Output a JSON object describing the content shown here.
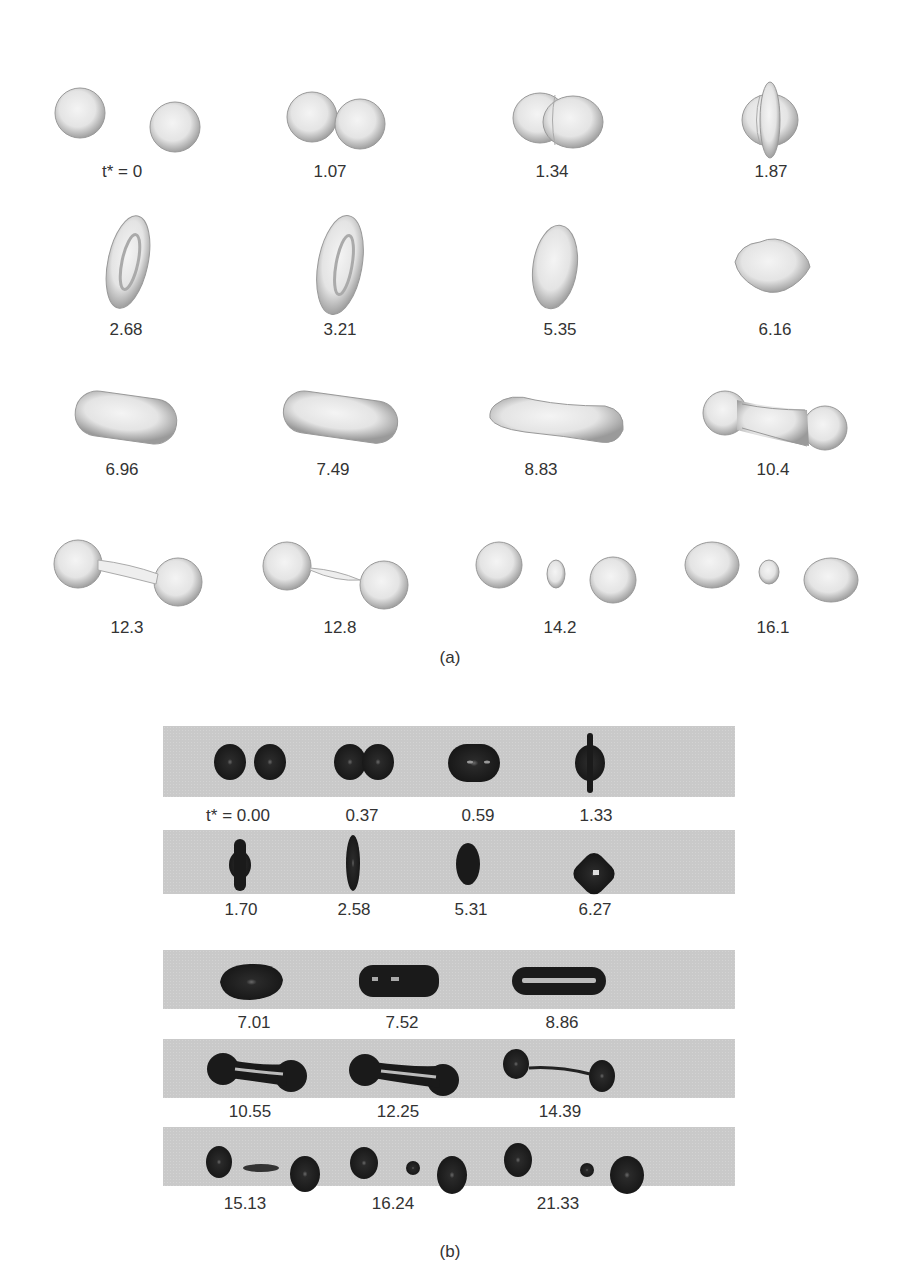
{
  "figure": {
    "panel_a": {
      "label": "(a)",
      "description": "Simulated 3D droplet collision sequence (light gray rendered surfaces)",
      "frames": [
        {
          "t": "t* = 0",
          "shape": "two separate spheres"
        },
        {
          "t": "1.07",
          "shape": "two spheres touching"
        },
        {
          "t": "1.34",
          "shape": "merged doublet"
        },
        {
          "t": "1.87",
          "shape": "flattened disk with rim"
        },
        {
          "t": "2.68",
          "shape": "tilted torus-like disk"
        },
        {
          "t": "3.21",
          "shape": "tilted torus-like disk"
        },
        {
          "t": "5.35",
          "shape": "oblate ellipsoid"
        },
        {
          "t": "6.16",
          "shape": "rounded rhombus"
        },
        {
          "t": "6.96",
          "shape": "elongated capsule"
        },
        {
          "t": "7.49",
          "shape": "elongated capsule"
        },
        {
          "t": "8.83",
          "shape": "stretched cylinder"
        },
        {
          "t": "10.4",
          "shape": "dumbbell"
        },
        {
          "t": "12.3",
          "shape": "two bulbs with thin ligament"
        },
        {
          "t": "12.8",
          "shape": "two bulbs with thinning ligament"
        },
        {
          "t": "14.2",
          "shape": "two drops with satellite droplet"
        },
        {
          "t": "16.1",
          "shape": "two drops with satellite droplet"
        }
      ]
    },
    "panel_b": {
      "label": "(b)",
      "description": "Experimental droplet collision images (dark drops on gray background)",
      "rows": [
        {
          "frames": [
            {
              "t": "t* = 0.00"
            },
            {
              "t": "0.37"
            },
            {
              "t": "0.59"
            },
            {
              "t": "1.33"
            }
          ]
        },
        {
          "frames": [
            {
              "t": "1.70"
            },
            {
              "t": "2.58"
            },
            {
              "t": "5.31"
            },
            {
              "t": "6.27"
            }
          ]
        },
        {
          "frames": [
            {
              "t": "7.01"
            },
            {
              "t": "7.52"
            },
            {
              "t": "8.86"
            }
          ]
        },
        {
          "frames": [
            {
              "t": "10.55"
            },
            {
              "t": "12.25"
            },
            {
              "t": "14.39"
            }
          ]
        },
        {
          "frames": [
            {
              "t": "15.13"
            },
            {
              "t": "16.24"
            },
            {
              "t": "21.33"
            }
          ]
        }
      ]
    }
  }
}
